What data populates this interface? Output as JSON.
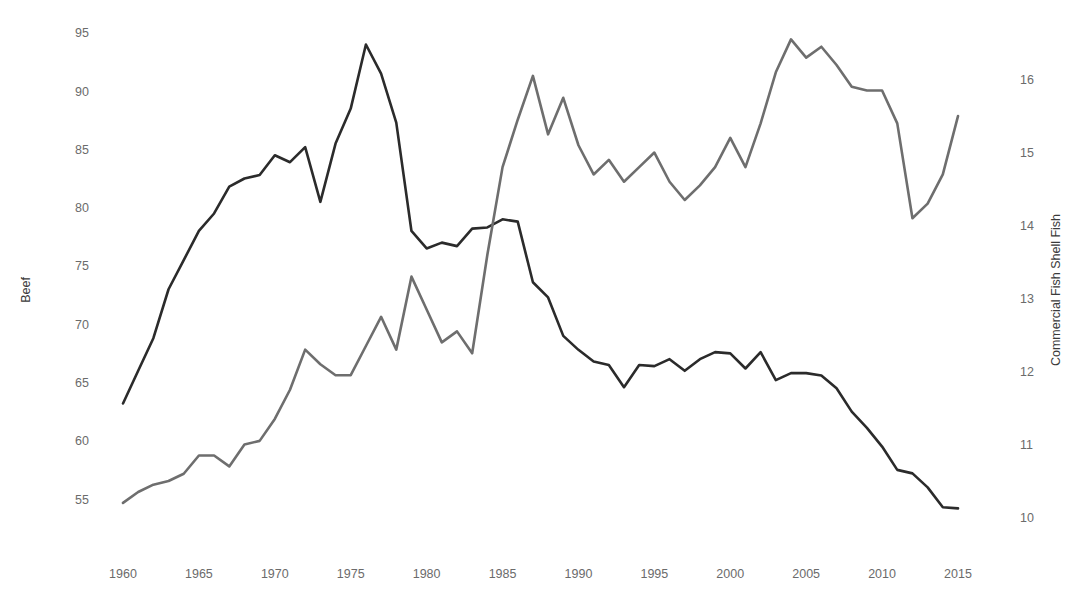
{
  "chart_data": {
    "type": "line",
    "title": "",
    "xlabel": "",
    "grid": false,
    "legend": "none",
    "x": [
      1960,
      1961,
      1962,
      1963,
      1964,
      1965,
      1966,
      1967,
      1968,
      1969,
      1970,
      1971,
      1972,
      1973,
      1974,
      1975,
      1976,
      1977,
      1978,
      1979,
      1980,
      1981,
      1982,
      1983,
      1984,
      1985,
      1986,
      1987,
      1988,
      1989,
      1990,
      1991,
      1992,
      1993,
      1994,
      1995,
      1996,
      1997,
      1998,
      1999,
      2000,
      2001,
      2002,
      2003,
      2004,
      2005,
      2006,
      2007,
      2008,
      2009,
      2010,
      2011,
      2012,
      2013,
      2014,
      2015
    ],
    "xlim": [
      1960,
      2015
    ],
    "xticks": [
      1960,
      1965,
      1970,
      1975,
      1980,
      1985,
      1990,
      1995,
      2000,
      2005,
      2010,
      2015
    ],
    "xticklabels": [
      "1960",
      "1965",
      "1970",
      "1975",
      "1980",
      "1985",
      "1990",
      "1995",
      "2000",
      "2005",
      "2010",
      "2015"
    ],
    "series": [
      {
        "name": "Beef",
        "axis": "left",
        "color": "#2b2b2b",
        "linewidth": 2.6,
        "ylabel": "Beef",
        "ylim": [
          52.6,
          95.5
        ],
        "yticks": [
          55,
          60,
          65,
          70,
          75,
          80,
          85,
          90,
          95
        ],
        "yticklabels": [
          "55",
          "60",
          "65",
          "70",
          "75",
          "80",
          "85",
          "90",
          "95"
        ],
        "values": [
          63.2,
          66.0,
          68.8,
          73.0,
          75.5,
          78.0,
          79.5,
          81.8,
          82.5,
          82.8,
          84.5,
          83.9,
          85.2,
          80.5,
          85.5,
          88.5,
          94.0,
          91.5,
          87.3,
          78.0,
          76.5,
          77.0,
          76.7,
          78.2,
          78.3,
          79.0,
          78.8,
          73.6,
          72.3,
          69.0,
          67.8,
          66.8,
          66.5,
          64.6,
          66.5,
          66.4,
          67.0,
          66.0,
          67.0,
          67.6,
          67.5,
          66.2,
          67.6,
          65.2,
          65.8,
          65.8,
          65.6,
          64.5,
          62.5,
          61.1,
          59.5,
          57.5,
          57.2,
          56.0,
          54.3,
          54.2
        ]
      },
      {
        "name": "Commercial Fish Shell Fish",
        "axis": "right",
        "color": "#6e6e6e",
        "linewidth": 2.6,
        "ylabel": "Commercial Fish Shell Fish",
        "ylim": [
          9.87,
          16.72
        ],
        "yticks": [
          10,
          11,
          12,
          13,
          14,
          15,
          16
        ],
        "yticklabels": [
          "10",
          "11",
          "12",
          "13",
          "14",
          "15",
          "16"
        ],
        "values": [
          10.2,
          10.35,
          10.45,
          10.5,
          10.6,
          10.85,
          10.85,
          10.7,
          11.0,
          11.05,
          11.35,
          11.75,
          12.3,
          12.1,
          11.95,
          11.95,
          12.35,
          12.75,
          12.3,
          13.3,
          12.85,
          12.4,
          12.55,
          12.25,
          13.6,
          14.8,
          15.45,
          16.05,
          15.25,
          15.75,
          15.1,
          14.7,
          14.9,
          14.6,
          14.8,
          15.0,
          14.6,
          14.35,
          14.55,
          14.8,
          15.2,
          14.8,
          15.4,
          16.1,
          16.55,
          16.3,
          16.45,
          16.2,
          15.9,
          15.85,
          15.85,
          15.4,
          14.1,
          14.3,
          14.7,
          15.5
        ]
      }
    ]
  },
  "axes": {
    "left_label": "Beef",
    "right_label": "Commercial Fish Shell Fish"
  }
}
